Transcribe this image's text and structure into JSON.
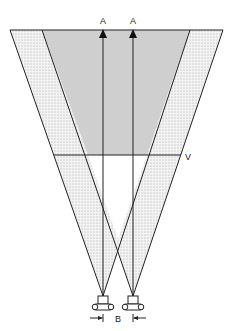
{
  "diagram": {
    "type": "stereo-camera-field-of-view",
    "labels": {
      "target_left": "A",
      "target_right": "A",
      "vergence_line": "V",
      "baseline": "B"
    },
    "colors": {
      "line": "#222222",
      "overlap_fill": "#d4d4d4",
      "stipple_fill": "#eeeeee",
      "stipple_dot": "#777777"
    }
  }
}
